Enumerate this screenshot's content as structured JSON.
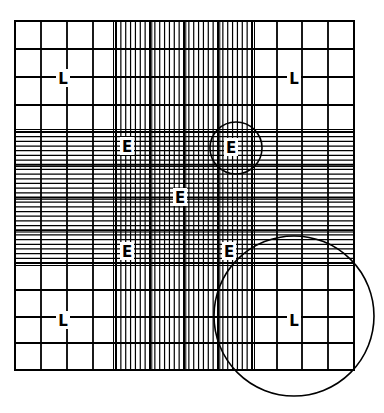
{
  "diagram": {
    "title": "",
    "colors": {
      "line": "#000000",
      "background": "#ffffff",
      "label_bg": "#ffffff"
    },
    "grid": {
      "left": 15,
      "top": 21,
      "right": 354,
      "bottom": 370,
      "outer_cols": [
        15,
        41,
        67,
        93,
        116
      ],
      "outer_cols_right": [
        252,
        277,
        302,
        328,
        354
      ],
      "outer_rows_top": [
        21,
        49,
        77,
        105,
        132
      ],
      "outer_rows_bottom": [
        263,
        290,
        317,
        343,
        370
      ],
      "center_band_x": [
        116,
        252
      ],
      "center_band_y": [
        132,
        263
      ],
      "center_line_count": 28
    },
    "labels": [
      {
        "text": "L",
        "x": 63,
        "y": 78,
        "role": "large-square-marker"
      },
      {
        "text": "L",
        "x": 294,
        "y": 78,
        "role": "large-square-marker"
      },
      {
        "text": "L",
        "x": 63,
        "y": 320,
        "role": "large-square-marker"
      },
      {
        "text": "L",
        "x": 294,
        "y": 320,
        "role": "large-square-marker"
      },
      {
        "text": "E",
        "x": 127,
        "y": 146,
        "role": "small-square-marker"
      },
      {
        "text": "E",
        "x": 231,
        "y": 147,
        "role": "small-square-marker"
      },
      {
        "text": "E",
        "x": 180,
        "y": 197,
        "role": "small-square-marker"
      },
      {
        "text": "E",
        "x": 127,
        "y": 251,
        "role": "small-square-marker"
      },
      {
        "text": "E",
        "x": 229,
        "y": 251,
        "role": "small-square-marker"
      }
    ],
    "circles": [
      {
        "cx": 236,
        "cy": 148,
        "r": 26,
        "role": "highlight-small-square"
      },
      {
        "cx": 294,
        "cy": 316,
        "r": 80,
        "role": "highlight-large-square"
      }
    ]
  }
}
